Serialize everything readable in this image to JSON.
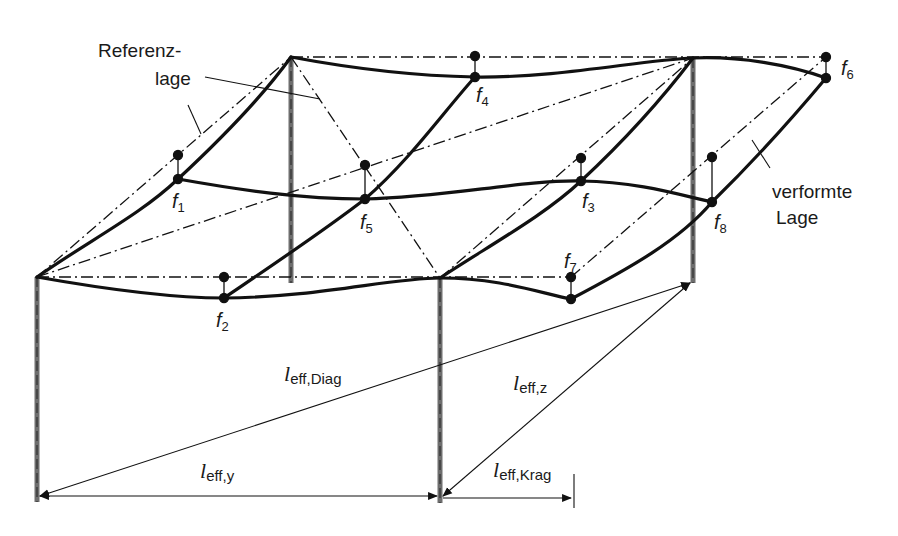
{
  "diagram": {
    "type": "structural deformation sketch",
    "labels": {
      "reference_line1": "Referenz-",
      "reference_line2": "lage",
      "deformed_line1": "verformte",
      "deformed_line2": "Lage"
    },
    "points": [
      {
        "id": "f1",
        "base": "f",
        "sub": "1"
      },
      {
        "id": "f2",
        "base": "f",
        "sub": "2"
      },
      {
        "id": "f3",
        "base": "f",
        "sub": "3"
      },
      {
        "id": "f4",
        "base": "f",
        "sub": "4"
      },
      {
        "id": "f5",
        "base": "f",
        "sub": "5"
      },
      {
        "id": "f6",
        "base": "f",
        "sub": "6"
      },
      {
        "id": "f7",
        "base": "f",
        "sub": "7"
      },
      {
        "id": "f8",
        "base": "f",
        "sub": "8"
      }
    ],
    "dimensions": [
      {
        "id": "diag",
        "base": "l",
        "sub": "eff,Diag"
      },
      {
        "id": "y",
        "base": "l",
        "sub": "eff,y"
      },
      {
        "id": "z",
        "base": "l",
        "sub": "eff,z"
      },
      {
        "id": "krag",
        "base": "l",
        "sub": "eff,Krag"
      }
    ],
    "colors": {
      "line": "#111111",
      "column": "#6e6e6e",
      "background": "#ffffff"
    }
  }
}
